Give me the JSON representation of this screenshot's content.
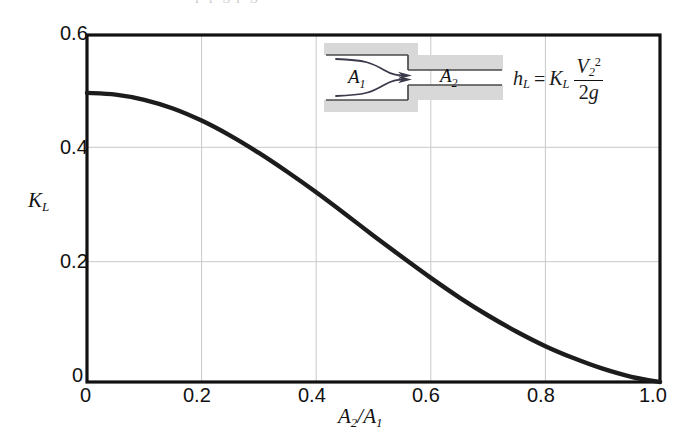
{
  "figure": {
    "kind": "line-plot",
    "scan_artifact_text": "l p p g p g"
  },
  "axes": {
    "y_title": "K",
    "y_title_sub": "L",
    "x_title_num": "A",
    "x_title_num_sub": "2",
    "x_title_slash": "/",
    "x_title_den": "A",
    "x_title_den_sub": "1",
    "x_ticks": [
      "0",
      "0.2",
      "0.4",
      "0.6",
      "0.8",
      "1.0"
    ],
    "y_ticks": [
      "0",
      "0.2",
      "0.4",
      "0.6"
    ],
    "frame_color": "#111111",
    "grid_color": "#c9c9c9",
    "curve_color": "#1c1c1c"
  },
  "inset": {
    "label_large_area": "A",
    "label_large_area_sub": "1",
    "label_small_area": "A",
    "label_small_area_sub": "2",
    "wall_fill": "#d8d8d8",
    "wall_line": "#4a4a4a",
    "streamline_color": "#3a3a4a"
  },
  "formula": {
    "lhs": "h",
    "lhs_sub": "L",
    "equals": "=",
    "coefficient": "K",
    "coefficient_sub": "L",
    "numerator": "V",
    "numerator_sub": "2",
    "numerator_sup": "2",
    "denominator_num": "2",
    "denominator_sym": "g",
    "plain": "h_L = K_L V_2^2 / (2g)"
  },
  "chart_data": {
    "type": "line",
    "title": "",
    "xlabel": "A2/A1",
    "ylabel": "KL",
    "xlim": [
      0,
      1.0
    ],
    "ylim": [
      0,
      0.6
    ],
    "xticks": [
      0,
      0.2,
      0.4,
      0.6,
      0.8,
      1.0
    ],
    "yticks": [
      0,
      0.2,
      0.4,
      0.6
    ],
    "grid": true,
    "legend": "none",
    "series": [
      {
        "name": "Sudden contraction loss coefficient",
        "x": [
          0.0,
          0.05,
          0.1,
          0.15,
          0.2,
          0.25,
          0.3,
          0.35,
          0.4,
          0.45,
          0.5,
          0.55,
          0.6,
          0.65,
          0.7,
          0.75,
          0.8,
          0.85,
          0.9,
          0.95,
          1.0
        ],
        "y": [
          0.5,
          0.497,
          0.488,
          0.473,
          0.452,
          0.426,
          0.396,
          0.363,
          0.328,
          0.291,
          0.253,
          0.216,
          0.18,
          0.146,
          0.115,
          0.087,
          0.062,
          0.041,
          0.023,
          0.009,
          0.0
        ]
      }
    ],
    "annotations": [
      {
        "text": "hL = KL V2^2/(2g)",
        "x": 0.76,
        "y": 0.545
      },
      {
        "text": "A1",
        "x": 0.43,
        "y": 0.525
      },
      {
        "text": "A2",
        "x": 0.64,
        "y": 0.505
      }
    ]
  }
}
